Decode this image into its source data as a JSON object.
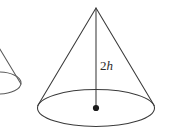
{
  "figure": {
    "type": "geometry-diagram",
    "background_color": "#ffffff",
    "stroke_color": "#3a3a3a",
    "label_color": "#2b2b2b",
    "canvas": {
      "width": 169,
      "height": 140
    },
    "labels": {
      "height_label_number": "2",
      "height_label_variable": "h",
      "height_label_full": "2h"
    },
    "main_cone": {
      "name": "main-cone",
      "apex": {
        "x": 96,
        "y": 8
      },
      "base_center": {
        "x": 96,
        "y": 108
      },
      "base_radius_x": 59,
      "base_radius_y": 18,
      "left_tangent": {
        "x": 38,
        "y": 99
      },
      "right_tangent": {
        "x": 154,
        "y": 99
      },
      "height_line": {
        "x1": 96,
        "y1": 8,
        "x2": 96,
        "y2": 108
      },
      "center_dot_radius": 3
    },
    "partial_cone": {
      "name": "partial-cone-left",
      "apex": {
        "x": -22,
        "y": 20
      },
      "base_center": {
        "x": 0,
        "y": 83
      },
      "base_radius_x": 22,
      "base_radius_y": 11,
      "clipped": "left-edge"
    }
  }
}
